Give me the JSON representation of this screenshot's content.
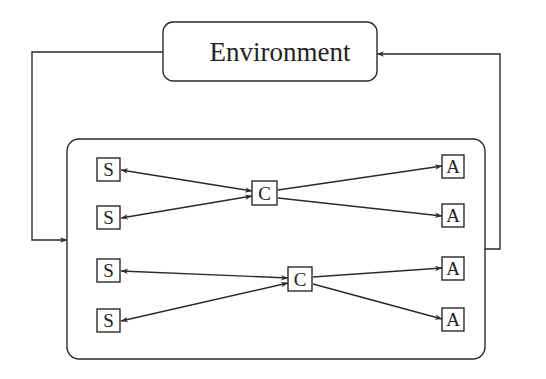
{
  "diagram": {
    "environment": {
      "label": "Environment"
    },
    "agent_container": {
      "label": ""
    },
    "nodes": {
      "sensors": [
        {
          "id": "s1",
          "label": "S"
        },
        {
          "id": "s2",
          "label": "S"
        },
        {
          "id": "s3",
          "label": "S"
        },
        {
          "id": "s4",
          "label": "S"
        }
      ],
      "controllers": [
        {
          "id": "c1",
          "label": "C"
        },
        {
          "id": "c2",
          "label": "C"
        }
      ],
      "actuators": [
        {
          "id": "a1",
          "label": "A"
        },
        {
          "id": "a2",
          "label": "A"
        },
        {
          "id": "a3",
          "label": "A"
        },
        {
          "id": "a4",
          "label": "A"
        }
      ]
    },
    "edges": [
      {
        "from": "environment",
        "to": "agent_container",
        "direction": "forward"
      },
      {
        "from": "agent_container",
        "to": "environment",
        "direction": "forward"
      },
      {
        "from": "c1",
        "to": "s1",
        "direction": "bidirectional"
      },
      {
        "from": "c1",
        "to": "s2",
        "direction": "bidirectional"
      },
      {
        "from": "c2",
        "to": "s3",
        "direction": "bidirectional"
      },
      {
        "from": "c2",
        "to": "s4",
        "direction": "bidirectional"
      },
      {
        "from": "c1",
        "to": "a1",
        "direction": "forward"
      },
      {
        "from": "c1",
        "to": "a2",
        "direction": "forward"
      },
      {
        "from": "c2",
        "to": "a3",
        "direction": "forward"
      },
      {
        "from": "c2",
        "to": "a4",
        "direction": "forward"
      }
    ],
    "colors": {
      "stroke": "#2a2a2a",
      "text": "#222222",
      "background": "#ffffff"
    }
  }
}
